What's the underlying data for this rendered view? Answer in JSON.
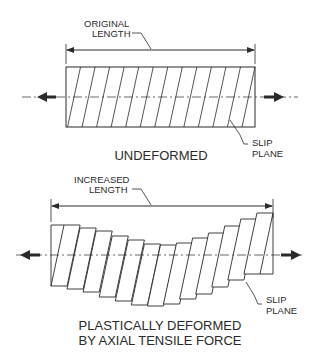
{
  "undeformed": {
    "dimension_label_line1": "ORIGINAL",
    "dimension_label_line2": "LENGTH",
    "slip_label_line1": "SLIP",
    "slip_label_line2": "PLANE",
    "caption": "UNDEFORMED",
    "slip_plane_count": 13
  },
  "deformed": {
    "dimension_label_line1": "INCREASED",
    "dimension_label_line2": "LENGTH",
    "slip_label_line1": "SLIP",
    "slip_label_line2": "PLANE",
    "caption_line1": "PLASTICALLY DEFORMED",
    "caption_line2": "BY AXIAL TENSILE FORCE",
    "block_count": 13
  },
  "colors": {
    "line": "#2a2a2a",
    "background": "#ffffff"
  }
}
